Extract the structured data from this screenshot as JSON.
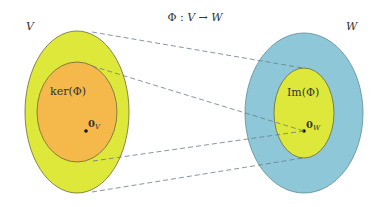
{
  "title": {
    "text": "Φ : V → W",
    "phi": "Φ",
    "colon": " : ",
    "domain": "V",
    "arrow": " → ",
    "codomain": "W"
  },
  "domain_space": {
    "label": "V",
    "fill": "#dde83a",
    "subset": {
      "label": "ker(Φ)",
      "fill": "#f5b84a"
    },
    "zero": {
      "base": "0",
      "subscript": "V"
    }
  },
  "codomain_space": {
    "label": "W",
    "fill": "#8ec8d8",
    "subset": {
      "label": "Im(Φ)",
      "fill": "#dde83a"
    },
    "zero": {
      "base": "0",
      "subscript": "W"
    }
  },
  "mappings": [
    {
      "from": "V boundary top",
      "to": "Im(Φ) boundary top"
    },
    {
      "from": "ker(Φ) boundary top",
      "to": "0_W"
    },
    {
      "from": "ker(Φ) boundary bottom",
      "to": "0_W"
    },
    {
      "from": "V boundary bottom",
      "to": "Im(Φ) boundary bottom"
    }
  ],
  "colors": {
    "outline": "#6b6b3a",
    "dash": "#6a7a8a",
    "text": "#333333"
  }
}
